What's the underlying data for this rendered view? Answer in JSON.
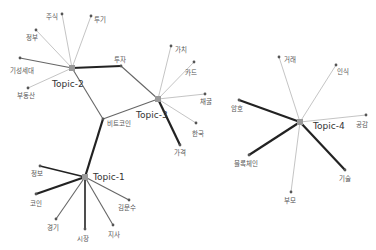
{
  "diagram": {
    "type": "topic-keyword network",
    "topics": [
      {
        "id": "t1",
        "label": "Topic-1",
        "x": 85,
        "y": 177,
        "lx": 93,
        "ly": 180
      },
      {
        "id": "t2",
        "label": "Topic-2",
        "x": 72,
        "y": 68,
        "lx": 52,
        "ly": 87
      },
      {
        "id": "t3",
        "label": "Topic-3",
        "x": 158,
        "y": 99,
        "lx": 136,
        "ly": 118
      },
      {
        "id": "t4",
        "label": "Topic-4",
        "x": 300,
        "y": 122,
        "lx": 313,
        "ly": 129
      }
    ],
    "terms": [
      {
        "id": "jusik",
        "label": "주식",
        "x": 62,
        "y": 14,
        "lx": 46,
        "ly": 19
      },
      {
        "id": "tugi",
        "label": "투기",
        "x": 91,
        "y": 16,
        "lx": 94,
        "ly": 22
      },
      {
        "id": "jeongbu",
        "label": "정부",
        "x": 36,
        "y": 30,
        "lx": 26,
        "ly": 40
      },
      {
        "id": "gisaengsedae",
        "label": "기성세대",
        "x": 20,
        "y": 58,
        "lx": 10,
        "ly": 73
      },
      {
        "id": "budongsan",
        "label": "부동산",
        "x": 28,
        "y": 88,
        "lx": 17,
        "ly": 98
      },
      {
        "id": "tuja",
        "label": "투자",
        "x": 121,
        "y": 66,
        "lx": 114,
        "ly": 62
      },
      {
        "id": "bitcoin",
        "label": "비트코인",
        "x": 103,
        "y": 119,
        "lx": 107,
        "ly": 126
      },
      {
        "id": "gachi",
        "label": "가치",
        "x": 171,
        "y": 46,
        "lx": 175,
        "ly": 52
      },
      {
        "id": "card",
        "label": "카드",
        "x": 194,
        "y": 62,
        "lx": 185,
        "ly": 75
      },
      {
        "id": "chaegul",
        "label": "채굴",
        "x": 205,
        "y": 94,
        "lx": 200,
        "ly": 104
      },
      {
        "id": "hanguk",
        "label": "한국",
        "x": 196,
        "y": 123,
        "lx": 192,
        "ly": 136
      },
      {
        "id": "gagyeok",
        "label": "가격",
        "x": 180,
        "y": 145,
        "lx": 174,
        "ly": 155
      },
      {
        "id": "jeongbo",
        "label": "정보",
        "x": 40,
        "y": 166,
        "lx": 31,
        "ly": 176
      },
      {
        "id": "coin",
        "label": "코인",
        "x": 36,
        "y": 194,
        "lx": 30,
        "ly": 206
      },
      {
        "id": "gyeonggi",
        "label": "경기",
        "x": 56,
        "y": 219,
        "lx": 47,
        "ly": 230
      },
      {
        "id": "sijang",
        "label": "시장",
        "x": 85,
        "y": 229,
        "lx": 77,
        "ly": 241
      },
      {
        "id": "jisa",
        "label": "지사",
        "x": 113,
        "y": 225,
        "lx": 108,
        "ly": 237
      },
      {
        "id": "gimunsu",
        "label": "김문수",
        "x": 129,
        "y": 200,
        "lx": 118,
        "ly": 210
      },
      {
        "id": "georae",
        "label": "거래",
        "x": 279,
        "y": 57,
        "lx": 284,
        "ly": 62
      },
      {
        "id": "insik",
        "label": "인식",
        "x": 336,
        "y": 65,
        "lx": 337,
        "ly": 74
      },
      {
        "id": "amho",
        "label": "암호",
        "x": 239,
        "y": 100,
        "lx": 231,
        "ly": 111
      },
      {
        "id": "gonggam",
        "label": "공감",
        "x": 366,
        "y": 115,
        "lx": 356,
        "ly": 127
      },
      {
        "id": "blockchain",
        "label": "블록체인",
        "x": 249,
        "y": 155,
        "lx": 234,
        "ly": 166
      },
      {
        "id": "gisul",
        "label": "기술",
        "x": 345,
        "y": 170,
        "lx": 339,
        "ly": 181
      },
      {
        "id": "bumo",
        "label": "부모",
        "x": 291,
        "y": 192,
        "lx": 284,
        "ly": 203
      }
    ],
    "edges": [
      {
        "from": "t2",
        "to": "jusik",
        "weight": 1
      },
      {
        "from": "t2",
        "to": "tugi",
        "weight": 1
      },
      {
        "from": "t2",
        "to": "jeongbu",
        "weight": 1
      },
      {
        "from": "t2",
        "to": "gisaengsedae",
        "weight": 1.5
      },
      {
        "from": "t2",
        "to": "budongsan",
        "weight": 1
      },
      {
        "from": "t2",
        "to": "tuja",
        "weight": 3
      },
      {
        "from": "t2",
        "to": "bitcoin",
        "weight": 1.5
      },
      {
        "from": "t3",
        "to": "tuja",
        "weight": 1.5
      },
      {
        "from": "t3",
        "to": "bitcoin",
        "weight": 1.5
      },
      {
        "from": "t3",
        "to": "gachi",
        "weight": 1
      },
      {
        "from": "t3",
        "to": "card",
        "weight": 1
      },
      {
        "from": "t3",
        "to": "chaegul",
        "weight": 1
      },
      {
        "from": "t3",
        "to": "hanguk",
        "weight": 1
      },
      {
        "from": "t3",
        "to": "gagyeok",
        "weight": 2.5
      },
      {
        "from": "t1",
        "to": "bitcoin",
        "weight": 3
      },
      {
        "from": "t1",
        "to": "jeongbo",
        "weight": 2
      },
      {
        "from": "t1",
        "to": "coin",
        "weight": 3
      },
      {
        "from": "t1",
        "to": "gyeonggi",
        "weight": 1.5
      },
      {
        "from": "t1",
        "to": "sijang",
        "weight": 2
      },
      {
        "from": "t1",
        "to": "jisa",
        "weight": 1.5
      },
      {
        "from": "t1",
        "to": "gimunsu",
        "weight": 1.5
      },
      {
        "from": "t4",
        "to": "georae",
        "weight": 1
      },
      {
        "from": "t4",
        "to": "insik",
        "weight": 1
      },
      {
        "from": "t4",
        "to": "amho",
        "weight": 2.5
      },
      {
        "from": "t4",
        "to": "gonggam",
        "weight": 1
      },
      {
        "from": "t4",
        "to": "blockchain",
        "weight": 3
      },
      {
        "from": "t4",
        "to": "gisul",
        "weight": 2.5
      },
      {
        "from": "t4",
        "to": "bumo",
        "weight": 1
      }
    ]
  },
  "colors": {
    "background": "#ffffff",
    "topic_node": "#999999",
    "term_node": "#555555",
    "edge_light": "#aaaaaa",
    "edge_dark": "#222222"
  }
}
